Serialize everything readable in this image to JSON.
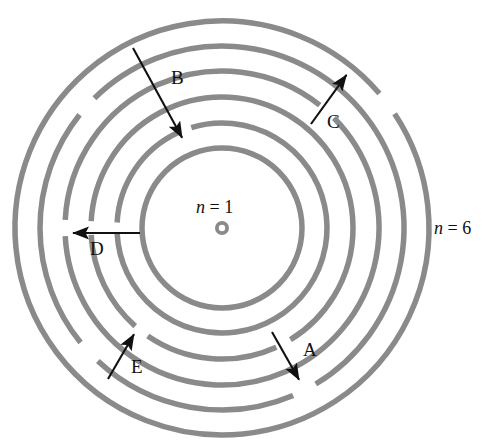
{
  "figure": {
    "background_color": "#ffffff",
    "orbit_color": "#8a8a8a",
    "arrow_color": "#111111",
    "nucleus_color": "#8a8a8a",
    "center": {
      "x": 222,
      "y": 228
    },
    "orbit_stroke_width": 5.5
  },
  "shells": [
    {
      "n": 1,
      "radius": 80
    },
    {
      "n": 2,
      "radius": 105
    },
    {
      "n": 3,
      "radius": 131
    },
    {
      "n": 4,
      "radius": 157
    },
    {
      "n": 5,
      "radius": 182
    },
    {
      "n": 6,
      "radius": 207
    }
  ],
  "shell_labels": {
    "inner": {
      "text": "n = 1",
      "n_italic": "n",
      "rest": " = 1",
      "x": 196,
      "y": 198
    },
    "outer": {
      "text": "n = 6",
      "n_italic": "n",
      "rest": " = 6",
      "x": 434,
      "y": 219
    }
  },
  "nucleus": {
    "name": "nucleus",
    "x": 222,
    "y": 228,
    "outer_radius": 7,
    "inner_radius": 3.2
  },
  "transitions": [
    {
      "id": "A",
      "label": "A",
      "direction": "outward",
      "from_shell": 3,
      "to_shell": 5,
      "tail": {
        "x": 272,
        "y": 332
      },
      "head": {
        "x": 302,
        "y": 385
      },
      "label_pos": {
        "x": 303,
        "y": 340
      }
    },
    {
      "id": "B",
      "label": "B",
      "direction": "inward",
      "from_shell": 5,
      "to_shell": 2,
      "tail": {
        "x": 133,
        "y": 48
      },
      "head": {
        "x": 185,
        "y": 143
      },
      "label_pos": {
        "x": 171,
        "y": 68
      }
    },
    {
      "id": "C",
      "label": "C",
      "direction": "outward",
      "from_shell": 4,
      "to_shell": 6,
      "tail": {
        "x": 311,
        "y": 124
      },
      "head": {
        "x": 350,
        "y": 70
      },
      "label_pos": {
        "x": 327,
        "y": 112
      }
    },
    {
      "id": "D",
      "label": "D",
      "direction": "outward",
      "from_shell": 2,
      "to_shell": 5,
      "tail": {
        "x": 140,
        "y": 233
      },
      "head": {
        "x": 67,
        "y": 233
      },
      "label_pos": {
        "x": 90,
        "y": 239
      }
    },
    {
      "id": "E",
      "label": "E",
      "direction": "inward",
      "from_shell": 5,
      "to_shell": 3,
      "tail": {
        "x": 108,
        "y": 379
      },
      "head": {
        "x": 137,
        "y": 329
      },
      "label_pos": {
        "x": 131,
        "y": 357
      }
    }
  ],
  "orbit_gaps": [
    {
      "shell": 5,
      "center_angle_deg": 222,
      "span_deg": 7
    },
    {
      "shell": 2,
      "center_angle_deg": 249,
      "span_deg": 8
    },
    {
      "shell": 4,
      "center_angle_deg": 312,
      "span_deg": 7
    },
    {
      "shell": 6,
      "center_angle_deg": 323,
      "span_deg": 7
    },
    {
      "shell": 2,
      "center_angle_deg": 180,
      "span_deg": 6
    },
    {
      "shell": 3,
      "center_angle_deg": 180,
      "span_deg": 6
    },
    {
      "shell": 4,
      "center_angle_deg": 180,
      "span_deg": 6
    },
    {
      "shell": 5,
      "center_angle_deg": 137,
      "span_deg": 8
    },
    {
      "shell": 3,
      "center_angle_deg": 128,
      "span_deg": 7
    },
    {
      "shell": 5,
      "center_angle_deg": 63,
      "span_deg": 8
    },
    {
      "shell": 3,
      "center_angle_deg": 62,
      "span_deg": 7
    }
  ],
  "artifacts": {
    "top_text": "",
    "watermark": ""
  }
}
